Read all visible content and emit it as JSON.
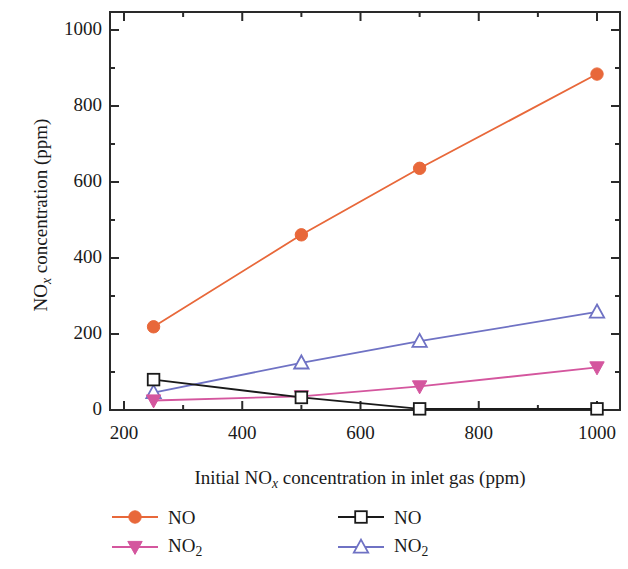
{
  "chart_data": {
    "type": "line",
    "title": "",
    "xlabel": "Initial NOx concentration in inlet gas (ppm)",
    "ylabel": "NOx concentration (ppm)",
    "xlim": [
      130,
      1060
    ],
    "ylim": [
      -40,
      1060
    ],
    "xticks": [
      200,
      400,
      600,
      800,
      1000
    ],
    "yticks": [
      0,
      200,
      400,
      600,
      800,
      1000
    ],
    "minor_ticks": true,
    "grid": false,
    "legend_position": "bottom",
    "x": [
      250,
      500,
      700,
      1000
    ],
    "series": [
      {
        "name": "NO",
        "marker": "filled-circle",
        "color": "#e8683a",
        "values": [
          219,
          461,
          636,
          884
        ]
      },
      {
        "name": "NO2",
        "marker": "filled-down-triangle",
        "color": "#d4569e",
        "values": [
          25,
          36,
          62,
          112
        ]
      },
      {
        "name": "NO",
        "marker": "open-square",
        "color": "#1a1a1a",
        "values": [
          80,
          33,
          3,
          3
        ]
      },
      {
        "name": "NO2",
        "marker": "open-up-triangle",
        "color": "#6f72c4",
        "values": [
          46,
          124,
          181,
          258
        ]
      }
    ]
  },
  "axes": {
    "y_title_pre": "NO",
    "y_title_sub": "x",
    "y_title_post": " concentration (ppm)",
    "x_title_pre": "Initial NO",
    "x_title_sub": "x",
    "x_title_post": " concentration in inlet gas (ppm)",
    "ytick_labels": [
      "1000",
      "800",
      "600",
      "400",
      "200",
      "0"
    ],
    "xtick_labels": [
      "200",
      "400",
      "600",
      "800",
      "1000"
    ]
  },
  "legend": {
    "entries": [
      {
        "label_pre": "NO",
        "label_sub": "",
        "marker": "filled-circle",
        "color": "#e8683a"
      },
      {
        "label_pre": "NO",
        "label_sub": "2",
        "marker": "filled-down-triangle",
        "color": "#d4569e"
      },
      {
        "label_pre": "NO",
        "label_sub": "",
        "marker": "open-square",
        "color": "#1a1a1a"
      },
      {
        "label_pre": "NO",
        "label_sub": "2",
        "marker": "open-up-triangle",
        "color": "#6f72c4"
      }
    ]
  }
}
